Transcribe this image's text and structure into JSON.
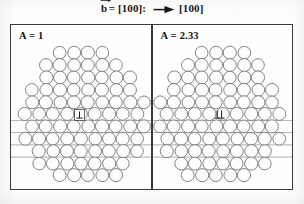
{
  "figure": {
    "header": {
      "burgers_symbol": "b",
      "burgers_vector": "= [100]:",
      "direction_label": "[100]",
      "arrow_icon": "right-arrow-icon",
      "vector_overbar_icon": "vector-arrow-icon"
    },
    "panels": [
      {
        "id": "left",
        "label": "A = 1",
        "aspect_value": "1",
        "dislocation_symbol": "⊥",
        "dislocation_count": 1,
        "dislocation_name": "single-dislocation-symbol"
      },
      {
        "id": "right",
        "label": "A = 2.33",
        "aspect_value": "2.33",
        "dislocation_symbol": "⊥⊥",
        "dislocation_count": 2,
        "dislocation_name": "double-dislocation-symbol"
      }
    ],
    "colors": {
      "frame_stroke": "#3a3a3a",
      "circle_stroke": "#6e6e6e",
      "circle_fill": "#fdfdfd",
      "text": "#141414",
      "background": "#fdfdfc",
      "slip_line": "#8a8a8a"
    },
    "lattice": {
      "type": "hexagonal-close-packed-circles",
      "circle_diameter_px": 14,
      "row_count": 11,
      "slip_plane_lines": 4
    }
  }
}
